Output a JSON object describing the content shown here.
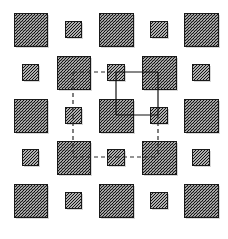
{
  "figure": {
    "title": "",
    "width": 228,
    "height": 239,
    "background_color": "#ffffff"
  },
  "style": {
    "node_border_color": "#1a1a1a",
    "node_fill_color": "#9a9a9a",
    "hatch_color": "#111111",
    "solid_edge_color": "#101010",
    "dashed_edge_color": "#2a2a2a",
    "large_node_size": 33,
    "small_node_size": 16
  },
  "grid": {
    "rows": 5,
    "columns": 5,
    "column_centers": [
      30.5,
      73,
      116,
      158.5,
      201
    ],
    "row_centers": [
      29.5,
      72,
      115,
      157.5,
      200
    ]
  },
  "nodes": [
    {
      "id": "r1c1",
      "row": 1,
      "col": 1,
      "size": "large",
      "x": 14,
      "y": 13,
      "w": 33,
      "h": 33
    },
    {
      "id": "r1c2",
      "row": 1,
      "col": 2,
      "size": "small",
      "x": 65,
      "y": 21,
      "w": 16,
      "h": 16
    },
    {
      "id": "r1c3",
      "row": 1,
      "col": 3,
      "size": "large",
      "x": 99,
      "y": 13,
      "w": 34,
      "h": 33
    },
    {
      "id": "r1c4",
      "row": 1,
      "col": 4,
      "size": "small",
      "x": 150,
      "y": 21,
      "w": 17,
      "h": 16
    },
    {
      "id": "r1c5",
      "row": 1,
      "col": 5,
      "size": "large",
      "x": 184,
      "y": 13,
      "w": 34,
      "h": 33
    },
    {
      "id": "r2c1",
      "row": 2,
      "col": 1,
      "size": "small",
      "x": 22,
      "y": 64,
      "w": 16,
      "h": 16
    },
    {
      "id": "r2c2",
      "row": 2,
      "col": 2,
      "size": "large",
      "x": 57,
      "y": 56,
      "w": 33,
      "h": 33
    },
    {
      "id": "r2c3",
      "row": 2,
      "col": 3,
      "size": "small",
      "x": 107,
      "y": 64,
      "w": 17,
      "h": 16
    },
    {
      "id": "r2c4",
      "row": 2,
      "col": 4,
      "size": "large",
      "x": 142,
      "y": 56,
      "w": 34,
      "h": 33
    },
    {
      "id": "r2c5",
      "row": 2,
      "col": 5,
      "size": "small",
      "x": 192,
      "y": 64,
      "w": 17,
      "h": 16
    },
    {
      "id": "r3c1",
      "row": 3,
      "col": 1,
      "size": "large",
      "x": 14,
      "y": 99,
      "w": 33,
      "h": 33
    },
    {
      "id": "r3c2",
      "row": 3,
      "col": 2,
      "size": "small",
      "x": 65,
      "y": 107,
      "w": 16,
      "h": 16
    },
    {
      "id": "r3c3",
      "row": 3,
      "col": 3,
      "size": "large",
      "x": 99,
      "y": 99,
      "w": 34,
      "h": 33
    },
    {
      "id": "r3c4",
      "row": 3,
      "col": 4,
      "size": "small",
      "x": 150,
      "y": 107,
      "w": 17,
      "h": 16
    },
    {
      "id": "r3c5",
      "row": 3,
      "col": 5,
      "size": "large",
      "x": 184,
      "y": 99,
      "w": 34,
      "h": 33
    },
    {
      "id": "r4c1",
      "row": 4,
      "col": 1,
      "size": "small",
      "x": 22,
      "y": 149,
      "w": 16,
      "h": 16
    },
    {
      "id": "r4c2",
      "row": 4,
      "col": 2,
      "size": "large",
      "x": 57,
      "y": 141,
      "w": 33,
      "h": 33
    },
    {
      "id": "r4c3",
      "row": 4,
      "col": 3,
      "size": "small",
      "x": 107,
      "y": 149,
      "w": 17,
      "h": 16
    },
    {
      "id": "r4c4",
      "row": 4,
      "col": 4,
      "size": "large",
      "x": 142,
      "y": 141,
      "w": 34,
      "h": 33
    },
    {
      "id": "r4c5",
      "row": 4,
      "col": 5,
      "size": "small",
      "x": 192,
      "y": 149,
      "w": 17,
      "h": 16
    },
    {
      "id": "r5c1",
      "row": 5,
      "col": 1,
      "size": "large",
      "x": 14,
      "y": 184,
      "w": 33,
      "h": 33
    },
    {
      "id": "r5c2",
      "row": 5,
      "col": 2,
      "size": "small",
      "x": 65,
      "y": 192,
      "w": 16,
      "h": 16
    },
    {
      "id": "r5c3",
      "row": 5,
      "col": 3,
      "size": "large",
      "x": 99,
      "y": 184,
      "w": 34,
      "h": 33
    },
    {
      "id": "r5c4",
      "row": 5,
      "col": 4,
      "size": "small",
      "x": 150,
      "y": 192,
      "w": 17,
      "h": 16
    },
    {
      "id": "r5c5",
      "row": 5,
      "col": 5,
      "size": "large",
      "x": 184,
      "y": 184,
      "w": 34,
      "h": 33
    }
  ],
  "edges": [
    {
      "id": "e-dash-r2c2-r2c3",
      "from": "r2c2",
      "to": "r2c3",
      "style": "dashed",
      "x1": 73,
      "y1": 72,
      "x2": 116,
      "y2": 72
    },
    {
      "id": "e-dash-r2c2-r3c2",
      "from": "r2c2",
      "to": "r3c2",
      "style": "dashed",
      "x1": 73,
      "y1": 72,
      "x2": 73,
      "y2": 115
    },
    {
      "id": "e-dash-r3c2-r4c2",
      "from": "r3c2",
      "to": "r4c2",
      "style": "dashed",
      "x1": 73,
      "y1": 115,
      "x2": 73,
      "y2": 157
    },
    {
      "id": "e-dash-r4c2-r4c3",
      "from": "r4c2",
      "to": "r4c3",
      "style": "dashed",
      "x1": 73,
      "y1": 157,
      "x2": 116,
      "y2": 157
    },
    {
      "id": "e-dash-r4c3-r4c4",
      "from": "r4c3",
      "to": "r4c4",
      "style": "dashed",
      "x1": 116,
      "y1": 157,
      "x2": 158,
      "y2": 157
    },
    {
      "id": "e-dash-r3c4-r4c4",
      "from": "r3c4",
      "to": "r4c4",
      "style": "dashed",
      "x1": 158,
      "y1": 115,
      "x2": 158,
      "y2": 157
    },
    {
      "id": "e-solid-r2c3-r2c4",
      "from": "r2c3",
      "to": "r2c4",
      "style": "solid",
      "x1": 116,
      "y1": 72,
      "x2": 158,
      "y2": 72
    },
    {
      "id": "e-solid-r2c3-r3c3",
      "from": "r2c3",
      "to": "r3c3",
      "style": "solid",
      "x1": 116,
      "y1": 72,
      "x2": 116,
      "y2": 115
    },
    {
      "id": "e-solid-r2c4-r3c4",
      "from": "r2c4",
      "to": "r3c4",
      "style": "solid",
      "x1": 158,
      "y1": 72,
      "x2": 158,
      "y2": 115
    },
    {
      "id": "e-solid-r3c3-r3c4",
      "from": "r3c3",
      "to": "r3c4",
      "style": "solid",
      "x1": 116,
      "y1": 115,
      "x2": 158,
      "y2": 115
    }
  ]
}
